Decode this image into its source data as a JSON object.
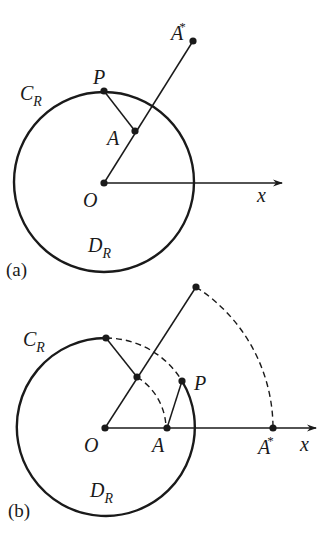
{
  "figure": {
    "panel_a": {
      "tag": "(a)",
      "labels": {
        "circle": "C",
        "circle_sub": "R",
        "disk": "D",
        "disk_sub": "R",
        "origin": "O",
        "point_p": "P",
        "point_a": "A",
        "point_a_star": "A",
        "star": "*",
        "axis": "x"
      }
    },
    "panel_b": {
      "tag": "(b)",
      "labels": {
        "circle": "C",
        "circle_sub": "R",
        "disk": "D",
        "disk_sub": "R",
        "origin": "O",
        "point_p": "P",
        "point_a": "A",
        "point_a_star": "A",
        "star": "*",
        "axis": "x"
      }
    },
    "colors": {
      "ink": "#1a1a1a",
      "background": "#ffffff"
    }
  }
}
